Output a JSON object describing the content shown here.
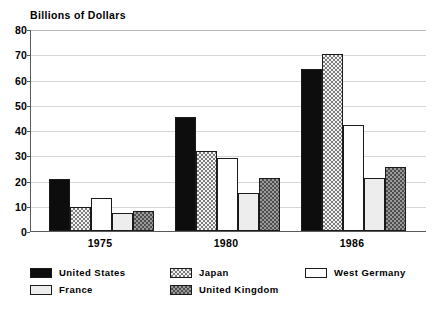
{
  "chart_data": {
    "type": "bar",
    "title": "Billions of Dollars",
    "xlabel": "",
    "ylabel": "",
    "ylim": [
      0,
      80
    ],
    "yticks": [
      0,
      10,
      20,
      30,
      40,
      50,
      60,
      70,
      80
    ],
    "grid": true,
    "legend_position": "below",
    "categories": [
      "1975",
      "1980",
      "1986"
    ],
    "series": [
      {
        "name": "United States",
        "key": "us",
        "pattern": "solid-black",
        "values": [
          20.5,
          45.0,
          64.0
        ]
      },
      {
        "name": "Japan",
        "key": "japan",
        "pattern": "light-checker",
        "values": [
          9.5,
          31.5,
          70.0
        ]
      },
      {
        "name": "West Germany",
        "key": "westgermany",
        "pattern": "white-outline",
        "values": [
          13.0,
          29.0,
          42.0
        ]
      },
      {
        "name": "France",
        "key": "france",
        "pattern": "very-light-gray",
        "values": [
          7.0,
          15.0,
          21.0
        ]
      },
      {
        "name": "United Kingdom",
        "key": "uk",
        "pattern": "dark-checker",
        "values": [
          8.0,
          21.0,
          25.5
        ]
      }
    ]
  },
  "legend": {
    "entries": [
      {
        "label": "United States",
        "key": "us",
        "row": 0,
        "col": 0
      },
      {
        "label": "Japan",
        "key": "japan",
        "row": 0,
        "col": 1
      },
      {
        "label": "West Germany",
        "key": "westgermany",
        "row": 0,
        "col": 2
      },
      {
        "label": "France",
        "key": "france",
        "row": 1,
        "col": 0
      },
      {
        "label": "United Kingdom",
        "key": "uk",
        "row": 1,
        "col": 1
      }
    ]
  },
  "colors": {
    "united_states": "#0d0d0d",
    "japan_base": "#f2f2f2",
    "japan_hatch": "#7d7d7d",
    "west_germany": "#ffffff",
    "france": "#ededed",
    "united_kingdom_base": "#9a9a9a",
    "united_kingdom_hatch": "#4f4f4f",
    "gridline": "#d6d6d6",
    "axis": "#5b5b5b",
    "text": "#000000",
    "background": "#ffffff"
  }
}
